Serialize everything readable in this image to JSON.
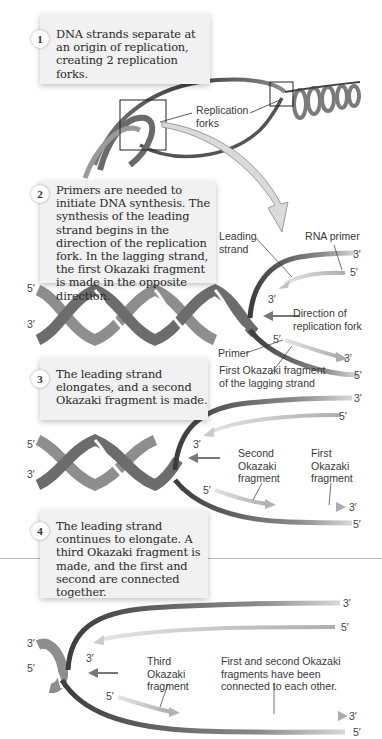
{
  "figure": {
    "colors": {
      "background": "#ffffff",
      "step_box": "#f1f1f1",
      "parental_strand_dark": "#4a4a4a",
      "parental_strand_light": "#a8a8a8",
      "new_strand_arrow": "#b9bec4",
      "text": "#2a2a2a",
      "leader_line": "#333333"
    },
    "steps": [
      {
        "number": "1",
        "text": "DNA strands separate at an origin of replication, creating 2 replication forks."
      },
      {
        "number": "2",
        "text": "Primers are needed to initiate DNA synthesis. The synthesis of the leading strand begins in the direction of the replication fork. In the lagging strand, the first Okazaki fragment is made in the opposite direction."
      },
      {
        "number": "3",
        "text": "The leading strand elongates, and a second Okazaki fragment is made."
      },
      {
        "number": "4",
        "text": "The leading strand continues to elongate. A third Okazaki fragment is made, and the first and second are connected together."
      }
    ],
    "panel1": {
      "label_replication_forks": "Replication forks"
    },
    "panel2": {
      "label_leading_strand": "Leading strand",
      "label_rna_primer": "RNA primer",
      "label_direction": "Direction of replication fork",
      "label_primer": "Primer",
      "label_first_okazaki": "First Okazaki fragment of the lagging strand",
      "ends": {
        "left_top": "5′",
        "left_bottom": "3′",
        "top_strand": "3′",
        "primer_5": "5′",
        "leading_3": "3′",
        "lagging_5": "5′",
        "okazaki_3": "3′",
        "bottom_strand": "5′"
      }
    },
    "panel3": {
      "label_second_okazaki": "Second Okazaki fragment",
      "label_first_okazaki": "First Okazaki fragment",
      "ends": {
        "left_top": "5′",
        "left_bottom": "3′",
        "top_strand": "3′",
        "leading_5": "5′",
        "leading_3": "3′",
        "lagging_5": "5′",
        "okazaki_3": "3′",
        "bottom_strand": "5′"
      }
    },
    "panel4": {
      "label_third_okazaki": "Third Okazaki fragment",
      "label_connected": "First and second Okazaki fragments have been connected to each other.",
      "ends": {
        "left_top": "3′",
        "left_bottom": "5′",
        "top_strand": "3′",
        "leading_5": "5′",
        "leading_3": "3′",
        "lagging_5": "5′",
        "okazaki_3": "3′",
        "bottom_strand": "5′"
      }
    }
  }
}
